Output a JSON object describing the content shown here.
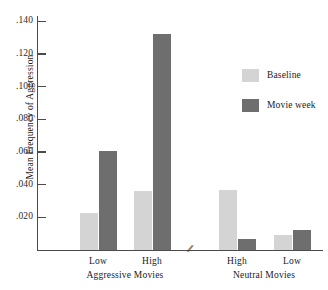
{
  "chart_data": {
    "type": "bar",
    "title": "",
    "xlabel": "",
    "ylabel": "Mean Frequency of Aggression",
    "ylim": [
      0,
      0.145
    ],
    "grid": false,
    "legend_position": "right",
    "axis_break": true,
    "axis_break_glyph": "//",
    "categories": [
      "Low",
      "High",
      "High",
      "Low"
    ],
    "groups": [
      {
        "label": "Aggressive Movies",
        "categories": [
          "Low",
          "High"
        ]
      },
      {
        "label": "Neutral Movies",
        "categories": [
          "High",
          "Low"
        ]
      }
    ],
    "series": [
      {
        "name": "Baseline",
        "color": "#d4d4d4",
        "values": [
          0.0225,
          0.036,
          0.0365,
          0.009
        ]
      },
      {
        "name": "Movie week",
        "color": "#6e6e6e",
        "values": [
          0.0605,
          0.132,
          0.007,
          0.0125
        ]
      }
    ],
    "yticks": [
      0.02,
      0.04,
      0.06,
      0.08,
      0.1,
      0.12,
      0.14
    ],
    "ytick_labels": [
      ".020",
      ".040",
      ".060",
      ".080",
      ".100",
      ".120",
      ".140"
    ]
  },
  "legend": {
    "entries": [
      {
        "label": "Baseline",
        "color": "#d4d4d4"
      },
      {
        "label": "Movie week",
        "color": "#6e6e6e"
      }
    ]
  },
  "axis": {
    "y_title": "Mean Frequency of Aggression",
    "break_glyph": "//"
  }
}
